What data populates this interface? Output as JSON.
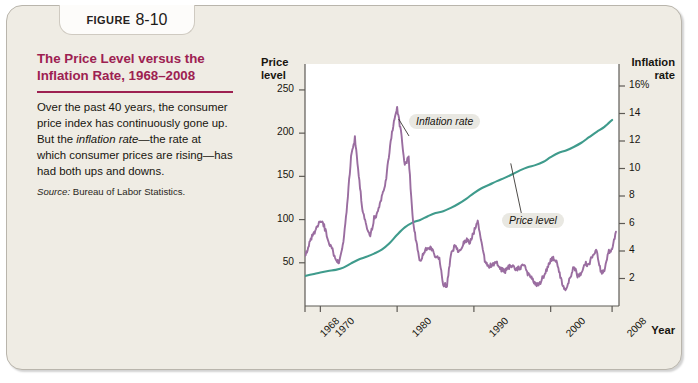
{
  "figure": {
    "tab_word": "Figure",
    "tab_number": "8-10",
    "title": "The Price Level versus the Inflation Rate, 1968–2008",
    "description_part1": "Over the past 40 years, the consumer price index has continuously gone up. But the ",
    "description_emphasis": "inflation rate",
    "description_part2": "—the rate at which consumer prices are rising—has had both ups and downs.",
    "source_word": "Source:",
    "source_text": " Bureau of Labor Statistics.",
    "accent_color": "#9d2151",
    "panel_color": "#efece4"
  },
  "chart_data": {
    "type": "line",
    "title": "The Price Level versus the Inflation Rate, 1968–2008",
    "xlabel": "Year",
    "ylabel": "Price level",
    "y2label": "Inflation rate",
    "xlim": [
      1968,
      2008.9
    ],
    "ylim": [
      0,
      280
    ],
    "y2lim": [
      0,
      17.6
    ],
    "grid": false,
    "legend_position": "inline-callouts",
    "xticks": [
      1968,
      1970,
      1980,
      1990,
      2000,
      2008
    ],
    "xtick_labels": [
      "1968",
      "1970",
      "1980",
      "1990",
      "2000",
      "2008"
    ],
    "yticks": [
      50,
      100,
      150,
      200,
      250
    ],
    "ytick_labels": [
      "50",
      "100",
      "150",
      "200",
      "250"
    ],
    "y2ticks": [
      2,
      4,
      6,
      8,
      10,
      12,
      14,
      16
    ],
    "y2tick_labels": [
      "2",
      "4",
      "6",
      "8",
      "10",
      "12",
      "14",
      "16%"
    ],
    "annotations": [
      {
        "text": "Inflation rate",
        "series": "inflation_rate",
        "x": 1982.0,
        "y2": 12.6
      },
      {
        "text": "Price level",
        "series": "price_level",
        "x": 1996.5,
        "y": 182
      }
    ],
    "series": [
      {
        "name": "Price level",
        "axis": "left",
        "color": "#3f9b8c",
        "unit": "CPI index (1982-84 = 100)",
        "x": [
          1968,
          1969,
          1970,
          1971,
          1972,
          1973,
          1974,
          1975,
          1976,
          1977,
          1978,
          1979,
          1980,
          1981,
          1982,
          1983,
          1984,
          1985,
          1986,
          1987,
          1988,
          1989,
          1990,
          1991,
          1992,
          1993,
          1994,
          1995,
          1996,
          1997,
          1998,
          1999,
          2000,
          2001,
          2002,
          2003,
          2004,
          2005,
          2006,
          2007,
          2008
        ],
        "values": [
          34.8,
          36.7,
          38.8,
          40.5,
          41.8,
          44.4,
          49.3,
          53.8,
          56.9,
          60.6,
          65.2,
          72.6,
          82.4,
          90.9,
          96.5,
          99.6,
          103.9,
          107.6,
          109.6,
          113.6,
          118.3,
          124.0,
          130.7,
          136.2,
          140.3,
          144.5,
          148.2,
          152.4,
          156.9,
          160.5,
          163.0,
          166.6,
          172.2,
          177.1,
          179.9,
          184.0,
          188.9,
          195.3,
          201.6,
          207.3,
          215.3
        ]
      },
      {
        "name": "Inflation rate",
        "axis": "right",
        "color": "#9a6da0",
        "unit": "percent change in CPI from year earlier",
        "x": [
          1968,
          1968.5,
          1969,
          1969.5,
          1970,
          1970.5,
          1971,
          1971.5,
          1972,
          1972.5,
          1973,
          1973.5,
          1974,
          1974.5,
          1975,
          1975.5,
          1976,
          1976.5,
          1977,
          1977.5,
          1978,
          1978.5,
          1979,
          1979.5,
          1980,
          1980.5,
          1981,
          1981.5,
          1982,
          1982.5,
          1983,
          1983.5,
          1984,
          1984.5,
          1985,
          1985.5,
          1986,
          1986.5,
          1987,
          1987.5,
          1988,
          1988.5,
          1989,
          1989.5,
          1990,
          1990.5,
          1991,
          1991.5,
          1992,
          1992.5,
          1993,
          1993.5,
          1994,
          1994.5,
          1995,
          1995.5,
          1996,
          1996.5,
          1997,
          1997.5,
          1998,
          1998.5,
          1999,
          1999.5,
          2000,
          2000.5,
          2001,
          2001.5,
          2002,
          2002.5,
          2003,
          2003.5,
          2004,
          2004.5,
          2005,
          2005.5,
          2006,
          2006.5,
          2007,
          2007.5,
          2008,
          2008.5
        ],
        "values": [
          3.6,
          4.4,
          5.2,
          5.6,
          6.2,
          5.8,
          4.8,
          4.2,
          3.3,
          3.2,
          4.6,
          7.4,
          10.9,
          12.2,
          9.4,
          7.0,
          5.9,
          5.0,
          6.4,
          6.8,
          7.9,
          9.0,
          11.2,
          13.2,
          14.4,
          12.6,
          10.3,
          10.8,
          6.6,
          4.6,
          3.2,
          3.9,
          4.3,
          4.2,
          3.6,
          3.4,
          1.6,
          1.5,
          3.7,
          4.4,
          4.0,
          4.4,
          4.8,
          4.6,
          5.4,
          6.2,
          4.6,
          3.1,
          2.9,
          3.0,
          3.1,
          2.7,
          2.5,
          2.8,
          2.9,
          2.6,
          2.8,
          3.0,
          2.3,
          2.2,
          1.6,
          1.5,
          2.1,
          2.6,
          3.4,
          3.5,
          2.8,
          1.6,
          1.2,
          2.0,
          2.9,
          2.2,
          2.3,
          3.1,
          3.0,
          3.8,
          4.1,
          2.5,
          2.5,
          3.9,
          4.2,
          5.4
        ]
      }
    ]
  }
}
